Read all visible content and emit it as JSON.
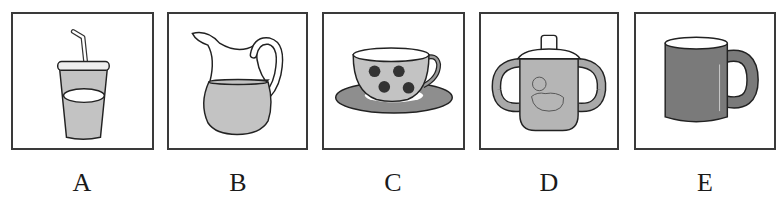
{
  "options": [
    {
      "letter": "A",
      "item": "disposable cup with straw",
      "icon": "cup-with-straw-icon"
    },
    {
      "letter": "B",
      "item": "pitcher",
      "icon": "pitcher-icon"
    },
    {
      "letter": "C",
      "item": "teacup with saucer",
      "icon": "teacup-icon"
    },
    {
      "letter": "D",
      "item": "sippy cup",
      "icon": "sippy-cup-icon"
    },
    {
      "letter": "E",
      "item": "mug",
      "icon": "mug-icon"
    }
  ],
  "colors": {
    "border": "#3a3a3a",
    "fill_light": "#c8c8c8",
    "fill_mid": "#a9a9a9",
    "fill_dark": "#7a7a7a",
    "outline": "#222222"
  }
}
